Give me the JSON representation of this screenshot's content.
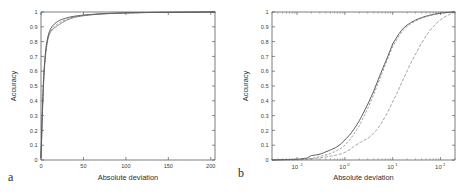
{
  "figure": {
    "background_color": "#ffffff",
    "axis_color": "#555a5e",
    "curve_colors": [
      "#3a3a3a",
      "#6e6e6e",
      "#7a7a7a"
    ]
  },
  "panels": [
    {
      "letter": "a",
      "xlabel": "Absolute deviation",
      "ylabel": "Accuracy"
    },
    {
      "letter": "b",
      "xlabel": "Absolute deviation",
      "ylabel": "Accuracy"
    }
  ],
  "chart_data": [
    {
      "type": "line",
      "title": "",
      "panel": "a",
      "xlabel": "Absolute deviation",
      "ylabel": "Accuracy",
      "xscale": "linear",
      "yscale": "linear",
      "xlim": [
        0,
        205
      ],
      "ylim": [
        0,
        1
      ],
      "grid": false,
      "legend": "none",
      "xticks": [
        0,
        50,
        100,
        150,
        200
      ],
      "xticklabels": [
        "0",
        "50",
        "100",
        "150",
        "200"
      ],
      "yticks": [
        0,
        0.1,
        0.2,
        0.3,
        0.4,
        0.5,
        0.6,
        0.7,
        0.8,
        0.9,
        1
      ],
      "yticklabels": [
        "0",
        "0.1",
        "0.2",
        "0.3",
        "0.4",
        "0.5",
        "0.6",
        "0.7",
        "0.8",
        "0.9",
        "1"
      ],
      "series": [
        {
          "name": "curve-1",
          "style": "solid",
          "x": [
            0,
            0.6,
            1.2,
            2,
            2.8,
            3.6,
            4.5,
            5.5,
            6.5,
            8,
            9.5,
            11.5,
            13.5,
            16,
            19,
            22,
            26,
            30,
            35,
            41,
            48,
            56,
            66,
            78,
            92,
            110,
            130,
            155,
            180,
            205
          ],
          "y": [
            0.02,
            0.13,
            0.26,
            0.4,
            0.52,
            0.61,
            0.68,
            0.74,
            0.785,
            0.83,
            0.862,
            0.888,
            0.906,
            0.921,
            0.934,
            0.944,
            0.953,
            0.96,
            0.967,
            0.973,
            0.978,
            0.982,
            0.986,
            0.99,
            0.993,
            0.995,
            0.997,
            0.998,
            0.999,
            1.0
          ]
        },
        {
          "name": "curve-2",
          "style": "solid",
          "x": [
            0,
            0.6,
            1.2,
            2,
            2.8,
            3.6,
            4.5,
            5.5,
            6.5,
            8,
            9.5,
            11.5,
            13.5,
            16,
            19,
            22,
            26,
            30,
            35,
            41,
            48,
            56,
            66,
            78,
            92,
            110,
            130,
            155,
            180,
            205
          ],
          "y": [
            0.015,
            0.11,
            0.23,
            0.365,
            0.485,
            0.578,
            0.652,
            0.714,
            0.762,
            0.812,
            0.845,
            0.868,
            0.882,
            0.893,
            0.906,
            0.917,
            0.932,
            0.944,
            0.956,
            0.966,
            0.973,
            0.979,
            0.985,
            0.989,
            0.992,
            0.995,
            0.997,
            0.998,
            0.999,
            1.0
          ]
        },
        {
          "name": "curve-3",
          "style": "dashed",
          "x": [
            0,
            0.6,
            1.2,
            2,
            2.8,
            3.6,
            4.5,
            5.5,
            6.5,
            8,
            9.5,
            11.5,
            13.5,
            16,
            19,
            22,
            26,
            30,
            35,
            41,
            48,
            56,
            66,
            78,
            92,
            110,
            130,
            155,
            180,
            205
          ],
          "y": [
            0.018,
            0.12,
            0.245,
            0.382,
            0.5,
            0.594,
            0.665,
            0.726,
            0.773,
            0.82,
            0.853,
            0.877,
            0.893,
            0.905,
            0.918,
            0.929,
            0.941,
            0.951,
            0.961,
            0.969,
            0.975,
            0.98,
            0.985,
            0.989,
            0.992,
            0.995,
            0.997,
            0.998,
            0.999,
            1.0
          ]
        }
      ]
    },
    {
      "type": "line",
      "title": "",
      "panel": "b",
      "xlabel": "Absolute deviation",
      "ylabel": "Accuracy",
      "xscale": "log",
      "yscale": "linear",
      "xlim": [
        0.03,
        200
      ],
      "ylim": [
        0,
        1
      ],
      "grid": false,
      "legend": "none",
      "xticks": [
        0.1,
        1,
        10,
        100
      ],
      "xticklabels": [
        "10^-1",
        "10^0",
        "10^1",
        "10^2"
      ],
      "yticks": [
        0,
        0.1,
        0.2,
        0.3,
        0.4,
        0.5,
        0.6,
        0.7,
        0.8,
        0.9,
        1
      ],
      "yticklabels": [
        "0",
        "0.1",
        "0.2",
        "0.3",
        "0.4",
        "0.5",
        "0.6",
        "0.7",
        "0.8",
        "0.9",
        "1"
      ],
      "series": [
        {
          "name": "curve-1",
          "style": "solid",
          "x": [
            0.03,
            0.1,
            0.16,
            0.2,
            0.26,
            0.32,
            0.4,
            0.5,
            0.63,
            0.8,
            1.0,
            1.3,
            1.6,
            2.0,
            2.5,
            3.2,
            4.0,
            5.0,
            6.3,
            8.0,
            10,
            13,
            16,
            20,
            25,
            32,
            40,
            50,
            63,
            80,
            100,
            130,
            200
          ],
          "y": [
            0.0,
            0.005,
            0.012,
            0.03,
            0.035,
            0.042,
            0.055,
            0.068,
            0.082,
            0.105,
            0.135,
            0.175,
            0.215,
            0.265,
            0.325,
            0.395,
            0.465,
            0.545,
            0.625,
            0.705,
            0.785,
            0.845,
            0.885,
            0.912,
            0.932,
            0.95,
            0.962,
            0.972,
            0.98,
            0.987,
            0.992,
            0.996,
            1.0
          ]
        },
        {
          "name": "curve-2",
          "style": "dashed",
          "x": [
            0.03,
            0.12,
            0.2,
            0.26,
            0.32,
            0.4,
            0.5,
            0.63,
            0.8,
            1.0,
            1.3,
            1.6,
            2.0,
            2.5,
            3.2,
            4.0,
            5.0,
            6.3,
            8.0,
            10,
            13,
            16,
            20,
            25,
            32,
            40,
            50,
            63,
            80,
            100,
            130,
            200
          ],
          "y": [
            0.0,
            0.003,
            0.01,
            0.018,
            0.026,
            0.034,
            0.044,
            0.058,
            0.075,
            0.1,
            0.14,
            0.182,
            0.232,
            0.295,
            0.368,
            0.442,
            0.522,
            0.606,
            0.69,
            0.768,
            0.83,
            0.872,
            0.902,
            0.925,
            0.944,
            0.958,
            0.969,
            0.978,
            0.986,
            0.991,
            0.996,
            1.0
          ]
        },
        {
          "name": "curve-3",
          "style": "dashdot",
          "x": [
            0.03,
            0.12,
            0.2,
            0.3,
            0.4,
            0.5,
            0.63,
            0.8,
            1.0,
            1.3,
            1.6,
            2.0,
            2.5,
            3.2,
            4.0,
            5.0,
            6.3,
            8.0,
            10,
            13,
            16,
            20,
            25,
            32,
            40,
            50,
            63,
            80,
            100,
            130,
            160,
            200
          ],
          "y": [
            0.0,
            0.002,
            0.008,
            0.014,
            0.02,
            0.026,
            0.032,
            0.04,
            0.052,
            0.072,
            0.095,
            0.115,
            0.132,
            0.152,
            0.18,
            0.218,
            0.268,
            0.328,
            0.395,
            0.468,
            0.535,
            0.602,
            0.668,
            0.732,
            0.79,
            0.84,
            0.884,
            0.92,
            0.948,
            0.972,
            0.986,
            1.0
          ]
        }
      ]
    }
  ]
}
